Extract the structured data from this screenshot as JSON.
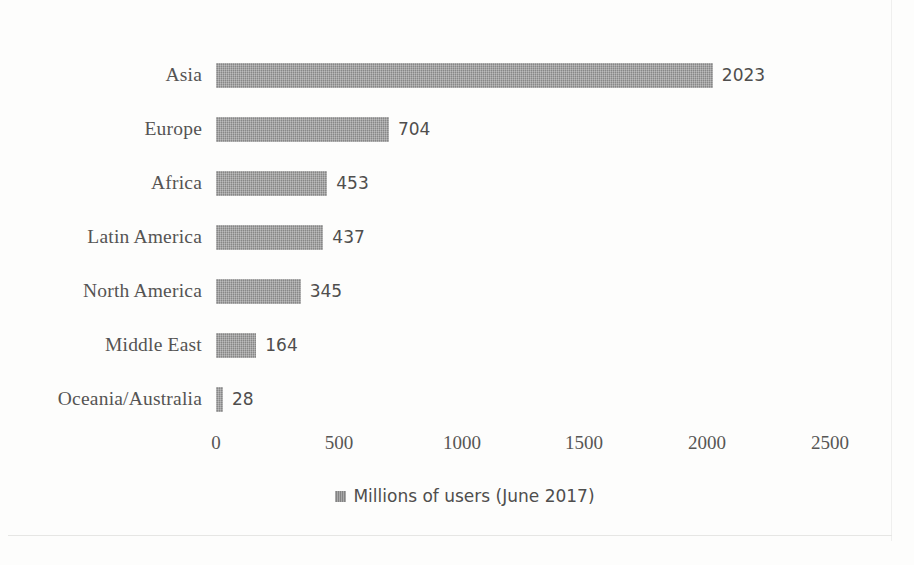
{
  "chart_data": {
    "type": "bar",
    "orientation": "horizontal",
    "title": "",
    "xlabel": "",
    "ylabel": "",
    "xlim": [
      0,
      2500
    ],
    "xticks": [
      "0",
      "500",
      "1000",
      "1500",
      "2000",
      "2500"
    ],
    "grid": false,
    "legend_position": "bottom",
    "legend": [
      "Millions of users (June 2017)"
    ],
    "categories": [
      "Asia",
      "Europe",
      "Africa",
      "Latin America",
      "North America",
      "Middle East",
      "Oceania/Australia"
    ],
    "values": [
      2023,
      704,
      453,
      437,
      345,
      164,
      28
    ],
    "data_labels": [
      "2023",
      "704",
      "453",
      "437",
      "345",
      "164",
      "28"
    ],
    "series": [
      {
        "name": "Millions of users (June 2017)",
        "values": [
          2023,
          704,
          453,
          437,
          345,
          164,
          28
        ],
        "color": "#8c8c8c"
      }
    ]
  },
  "rows": [
    {
      "label": "Asia",
      "value": 2023,
      "data_label": "2023"
    },
    {
      "label": "Europe",
      "value": 704,
      "data_label": "704"
    },
    {
      "label": "Africa",
      "value": 453,
      "data_label": "453"
    },
    {
      "label": "Latin America",
      "value": 437,
      "data_label": "437"
    },
    {
      "label": "North America",
      "value": 345,
      "data_label": "345"
    },
    {
      "label": "Middle East",
      "value": 164,
      "data_label": "164"
    },
    {
      "label": "Oceania/Australia",
      "value": 28,
      "data_label": "28"
    }
  ],
  "axis": {
    "ticks": [
      "0",
      "500",
      "1000",
      "1500",
      "2000",
      "2500"
    ]
  },
  "legend": {
    "label": "Millions of users (June 2017)"
  },
  "colors": {
    "bar": "#8c8c8c",
    "label_text": "#555453",
    "value_text": "#4f4e4d",
    "background": "#fdfdfc"
  }
}
